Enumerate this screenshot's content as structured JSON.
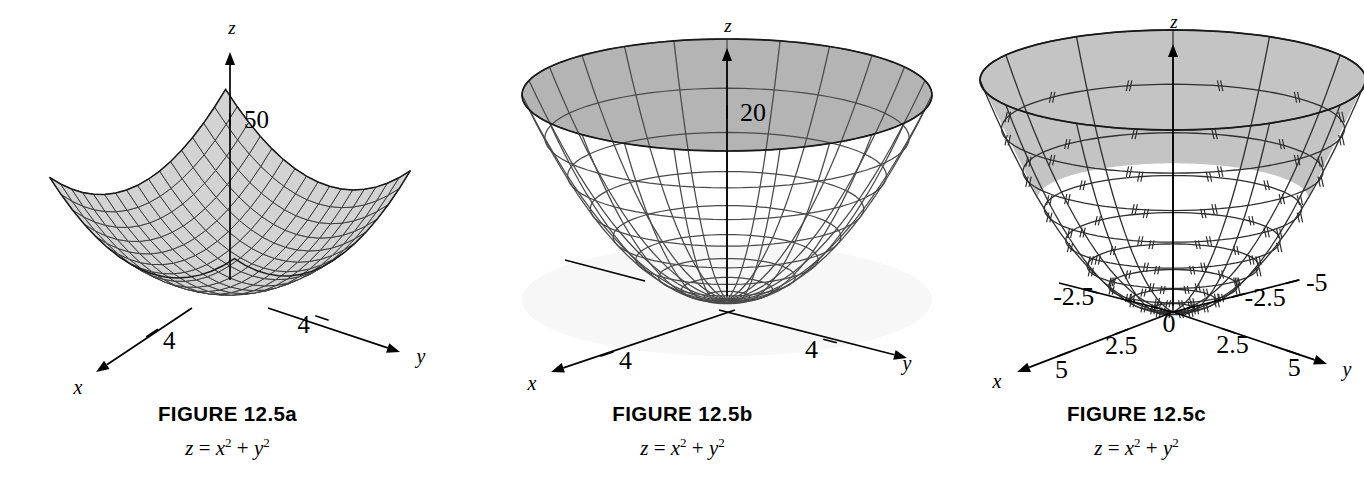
{
  "figures": [
    {
      "id": "a",
      "caption_title": "FIGURE 12.5a",
      "equation_z": "z",
      "equation_eq": "=",
      "equation_x": "x",
      "equation_xsup": "2",
      "equation_plus": "+",
      "equation_y": "y",
      "equation_ysup": "2",
      "axis_x_label": "x",
      "axis_y_label": "y",
      "axis_z_label": "z",
      "z_tick_label": "50",
      "x_tick_label": "4",
      "y_tick_label": "4",
      "view": "above",
      "surface_fill": "#d3d3d3",
      "mesh_color": "#3a3a3a"
    },
    {
      "id": "b",
      "caption_title": "FIGURE 12.5b",
      "equation_z": "z",
      "equation_eq": "=",
      "equation_x": "x",
      "equation_xsup": "2",
      "equation_plus": "+",
      "equation_y": "y",
      "equation_ysup": "2",
      "axis_x_label": "x",
      "axis_y_label": "y",
      "axis_z_label": "z",
      "z_tick_label": "20",
      "x_tick_label": "4",
      "y_tick_label": "4",
      "view": "side",
      "surface_fill_inner": "#b4b4b4",
      "surface_fill_outer": "#f7f7f7",
      "mesh_color": "#4a4a4a"
    },
    {
      "id": "c",
      "caption_title": "FIGURE 12.5c",
      "equation_z": "z",
      "equation_eq": "=",
      "equation_x": "x",
      "equation_xsup": "2",
      "equation_plus": "+",
      "equation_y": "y",
      "equation_ysup": "2",
      "axis_x_label": "x",
      "axis_y_label": "y",
      "axis_z_label": "z",
      "origin_label": "0",
      "x_ticks_positive": [
        "2.5",
        "5"
      ],
      "x_ticks_negative": [
        "-2.5"
      ],
      "y_ticks_positive": [
        "2.5",
        "5"
      ],
      "y_ticks_negative": [
        "-2.5",
        "-5"
      ],
      "view": "side-coarse",
      "surface_fill_inner": "#c4c4c4",
      "surface_fill_outer": "#fbfbfb",
      "mesh_color": "#2f2f2f"
    }
  ],
  "chart_data": {
    "type": "line",
    "panels": [
      {
        "label": "FIGURE 12.5a",
        "function": "z = x^2 + y^2",
        "projection": "3d-wireframe-surface",
        "camera": "high elevation, looking down into the bowl",
        "xlabel": "x",
        "ylabel": "y",
        "zlabel": "z",
        "xlim": [
          -4,
          4
        ],
        "ylim": [
          -4,
          4
        ],
        "zlim": [
          0,
          50
        ],
        "xticks": [
          4
        ],
        "yticks": [
          4
        ],
        "zticks": [
          50
        ],
        "mesh_u": 16,
        "mesh_v": 16,
        "grid": true,
        "legend": false
      },
      {
        "label": "FIGURE 12.5b",
        "function": "z = x^2 + y^2",
        "projection": "3d-wireframe-surface",
        "camera": "low elevation, bowl seen nearly edge-on",
        "xlabel": "x",
        "ylabel": "y",
        "zlabel": "z",
        "xlim": [
          -4,
          4
        ],
        "ylim": [
          -4,
          4
        ],
        "zlim": [
          0,
          20
        ],
        "xticks": [
          4
        ],
        "yticks": [
          4
        ],
        "zticks": [
          20
        ],
        "mesh_u": 20,
        "mesh_v": 12,
        "grid": true,
        "legend": false
      },
      {
        "label": "FIGURE 12.5c",
        "function": "z = x^2 + y^2",
        "projection": "3d-wireframe-surface",
        "camera": "low elevation, coarse level-curve mesh with hatching",
        "xlabel": "x",
        "ylabel": "y",
        "zlabel": "z",
        "xlim": [
          -5,
          5
        ],
        "ylim": [
          -5,
          5
        ],
        "zlim": [
          0,
          25
        ],
        "xticks": [
          -2.5,
          0,
          2.5,
          5
        ],
        "yticks": [
          -5,
          -2.5,
          0,
          2.5,
          5
        ],
        "zticks": [],
        "mesh_u": 12,
        "mesh_v": 9,
        "grid": true,
        "legend": false,
        "origin_label": "0"
      }
    ]
  }
}
